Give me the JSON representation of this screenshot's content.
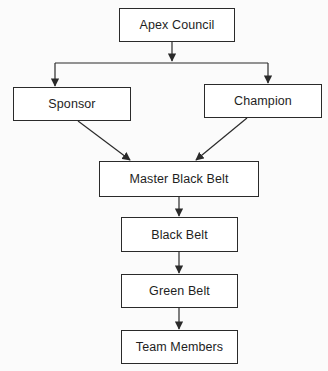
{
  "diagram": {
    "title": "",
    "nodes": [
      {
        "id": "apex",
        "label": "Apex Council"
      },
      {
        "id": "sponsor",
        "label": "Sponsor"
      },
      {
        "id": "champion",
        "label": "Champion"
      },
      {
        "id": "mbb",
        "label": "Master Black Belt"
      },
      {
        "id": "bb",
        "label": "Black Belt"
      },
      {
        "id": "gb",
        "label": "Green Belt"
      },
      {
        "id": "tm",
        "label": "Team Members"
      }
    ],
    "edges": [
      {
        "from": "apex",
        "to": "sponsor"
      },
      {
        "from": "apex",
        "to": "champion"
      },
      {
        "from": "sponsor",
        "to": "mbb"
      },
      {
        "from": "champion",
        "to": "mbb"
      },
      {
        "from": "mbb",
        "to": "bb"
      },
      {
        "from": "bb",
        "to": "gb"
      },
      {
        "from": "gb",
        "to": "tm"
      }
    ],
    "colors": {
      "stroke": "#2a2a2a",
      "text": "#1e1e1e",
      "box_fill": "#ffffff"
    }
  }
}
